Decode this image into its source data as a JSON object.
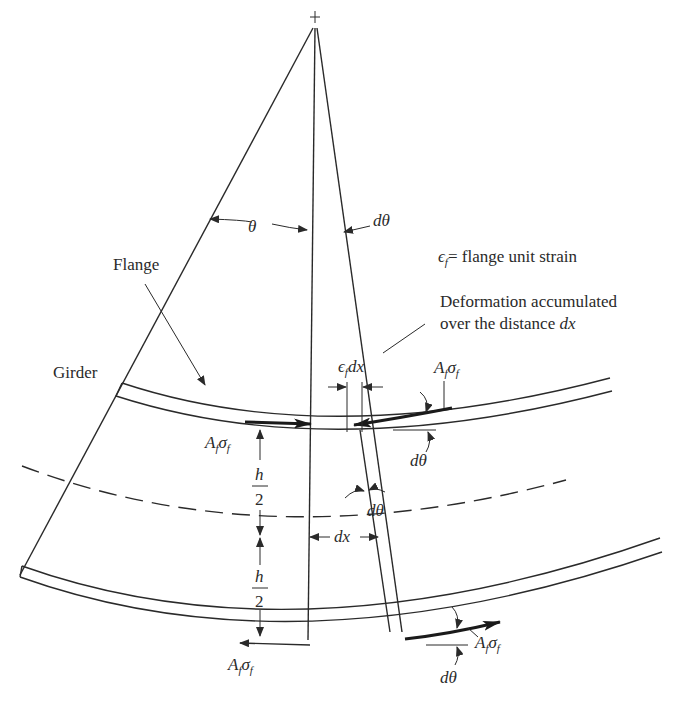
{
  "diagram": {
    "type": "curved girder flange force free-body diagram",
    "labels": {
      "theta": "θ",
      "dtheta_top": "dθ",
      "strain_def_eps": "ϵ",
      "strain_def_sub": "f",
      "strain_def_text": "= flange unit strain",
      "deformation_line1": "Deformation accumulated",
      "deformation_line2_prefix": "over the distance ",
      "deformation_line2_var": "dx",
      "flange": "Flange",
      "girder": "Girder",
      "eps_dx_eps": "ϵ",
      "eps_dx_sub": "f",
      "eps_dx_var": "dx",
      "force_A": "A",
      "force_sub_f": "f",
      "force_sigma": "σ",
      "h": "h",
      "two": "2",
      "dx": "dx",
      "dtheta_mid": "dθ",
      "dtheta_top_right": "dθ",
      "dtheta_bottom_right": "dθ"
    },
    "colors": {
      "line": "#2a2a2a",
      "background": "#ffffff"
    }
  }
}
